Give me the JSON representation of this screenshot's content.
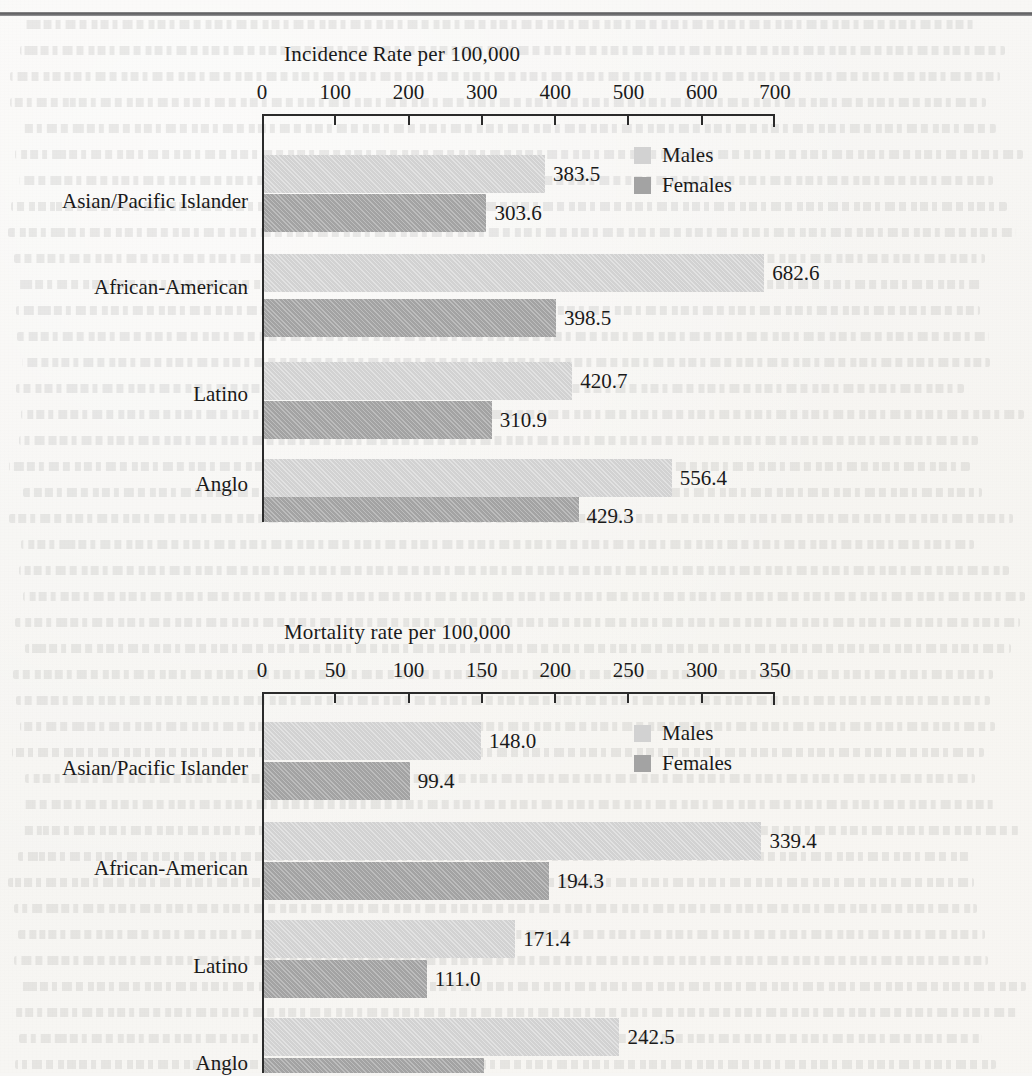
{
  "page": {
    "background_color": "#f7f6f4",
    "top_rule_color": "#5b5b5d"
  },
  "legend_colors": {
    "males": "#d2d2d2",
    "females": "#a3a3a3"
  },
  "legend": {
    "males_label": "Males",
    "females_label": "Females"
  },
  "chart_data": [
    {
      "type": "bar",
      "orientation": "horizontal",
      "title": "Incidence Rate per 100,000",
      "xlabel": "",
      "ylabel": "",
      "categories": [
        "Asian/Pacific Islander",
        "African-American",
        "Latino",
        "Anglo"
      ],
      "series": [
        {
          "name": "Males",
          "values": [
            383.5,
            682.6,
            420.7,
            556.4
          ]
        },
        {
          "name": "Females",
          "values": [
            303.6,
            398.5,
            310.9,
            429.3
          ]
        }
      ],
      "value_labels": [
        [
          "383.5",
          "303.6"
        ],
        [
          "682.6",
          "398.5"
        ],
        [
          "420.7",
          "310.9"
        ],
        [
          "556.4",
          "429.3"
        ]
      ],
      "xlim": [
        0,
        700
      ],
      "xticks": [
        0,
        100,
        200,
        300,
        400,
        500,
        600,
        700
      ],
      "xtick_labels": [
        "0",
        "100",
        "200",
        "300",
        "400",
        "500",
        "600",
        "700"
      ],
      "grid": false,
      "legend_position": "top-right"
    },
    {
      "type": "bar",
      "orientation": "horizontal",
      "title": "Mortality rate per 100,000",
      "xlabel": "",
      "ylabel": "",
      "categories": [
        "Asian/Pacific Islander",
        "African-American",
        "Latino",
        "Anglo"
      ],
      "series": [
        {
          "name": "Males",
          "values": [
            148.0,
            339.4,
            171.4,
            242.5
          ]
        },
        {
          "name": "Females",
          "values": [
            99.4,
            194.3,
            111.0,
            150.0
          ]
        }
      ],
      "value_labels": [
        [
          "148.0",
          "99.4"
        ],
        [
          "339.4",
          "194.3"
        ],
        [
          "171.4",
          "111.0"
        ],
        [
          "242.5",
          ""
        ]
      ],
      "xlim": [
        0,
        350
      ],
      "xticks": [
        0,
        50,
        100,
        150,
        200,
        250,
        300,
        350
      ],
      "xtick_labels": [
        "0",
        "50",
        "100",
        "150",
        "200",
        "250",
        "300",
        "350"
      ],
      "grid": false,
      "legend_position": "top-right",
      "note": "bottom of chart is cropped by the page edge"
    }
  ]
}
